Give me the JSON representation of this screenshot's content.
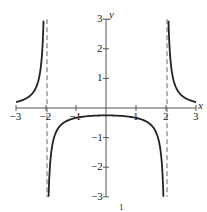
{
  "chart_data": {
    "type": "line",
    "title": "",
    "function": "y = 1/(x^2 - 4)",
    "xlabel": "x",
    "ylabel": "y",
    "xlim": [
      -3,
      3
    ],
    "ylim": [
      -3,
      3
    ],
    "grid": false,
    "legend": null,
    "x_ticks": [
      -3,
      -2,
      -1,
      1,
      2,
      3
    ],
    "x_tick_labels": [
      "−3",
      "−2",
      "−1",
      "1",
      "2",
      "3"
    ],
    "y_ticks": [
      -3,
      -2,
      -1,
      1,
      2,
      3
    ],
    "y_tick_labels": [
      "−3",
      "−2",
      "−1",
      "1",
      "2",
      "3"
    ],
    "asymptotes": {
      "vertical": [
        -2,
        2
      ],
      "style": "dashed"
    },
    "series": [
      {
        "name": "left branch",
        "x": [
          -3,
          -2.8,
          -2.6,
          -2.4,
          -2.3,
          -2.2,
          -2.15,
          -2.1,
          -2.08
        ],
        "y": [
          0.2,
          0.26,
          0.36,
          0.57,
          0.78,
          1.19,
          1.61,
          2.44,
          3.0
        ]
      },
      {
        "name": "middle branch",
        "x": [
          -1.92,
          -1.9,
          -1.8,
          -1.6,
          -1.2,
          -0.8,
          0,
          0.8,
          1.2,
          1.6,
          1.8,
          1.9,
          1.92
        ],
        "y": [
          -3.0,
          -2.56,
          -1.32,
          -0.69,
          -0.39,
          -0.3,
          -0.25,
          -0.3,
          -0.39,
          -0.69,
          -1.32,
          -2.56,
          -3.0
        ]
      },
      {
        "name": "right branch",
        "x": [
          2.08,
          2.1,
          2.15,
          2.2,
          2.3,
          2.4,
          2.6,
          2.8,
          3
        ],
        "y": [
          3.0,
          2.44,
          1.61,
          1.19,
          0.78,
          0.57,
          0.36,
          0.26,
          0.2
        ]
      }
    ],
    "annotations": [
      "1"
    ]
  },
  "labels": {
    "x_axis": "x",
    "y_axis": "y",
    "caption_fragment": "1"
  },
  "colors": {
    "curve": "#222222",
    "axes": "#555555",
    "asymptote": "#666666",
    "background": "#ffffff"
  }
}
